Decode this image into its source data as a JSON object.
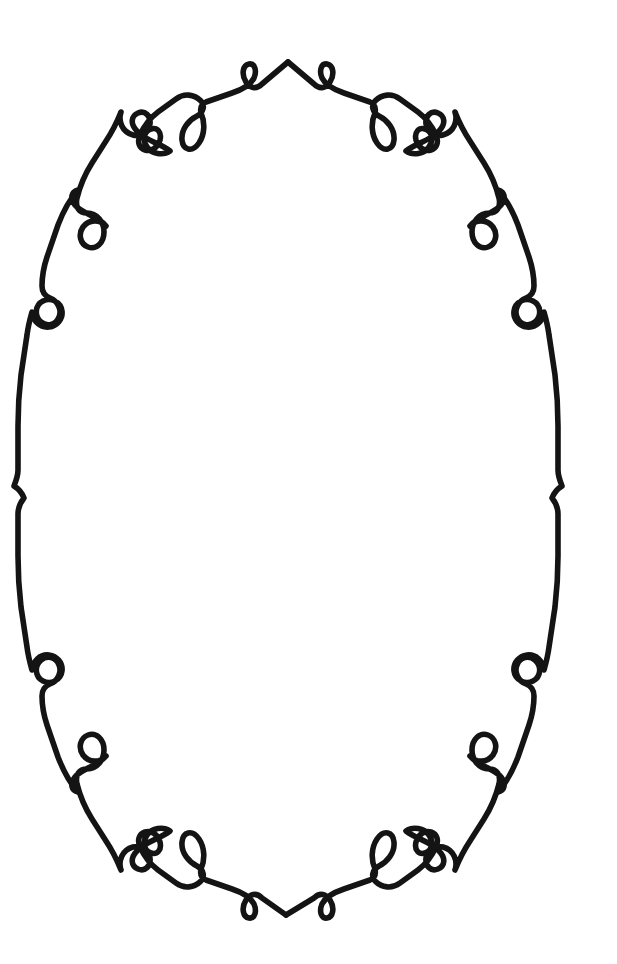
{
  "artwork": {
    "title": "Ornamental Oval Scroll Frame",
    "kind": "line-art-decorative-border",
    "medium": "black ink line drawing",
    "canvas": {
      "width": 617,
      "height": 964
    },
    "background_color": "#ffffff",
    "ink_color": "#141414",
    "stroke_width": 5.6,
    "symmetry": "bilateral vertical axis at x=287; near mirror symmetry about horizontal axis y=492",
    "bounds": {
      "left": 14,
      "right": 560,
      "top": 58,
      "bottom": 925
    },
    "center": {
      "x": 287,
      "y": 492
    },
    "description": "A single continuous hand-drawn black line forms a tall oval cartouche frame. The line is punctuated at regular intervals by decorative flourishes: teardrop loops, small closed rings, paired C-scroll curls and pointed cusps. The interior is empty white space.",
    "ornaments": [
      {
        "name": "top-apex-peak",
        "shape": "upward point",
        "x": 288,
        "y": 62
      },
      {
        "name": "top-loop-left",
        "shape": "small teardrop loop",
        "x": 248,
        "y": 75
      },
      {
        "name": "top-loop-right",
        "shape": "small teardrop loop",
        "x": 325,
        "y": 75
      },
      {
        "name": "shoulder-loop-left",
        "shape": "teardrop loop",
        "x": 195,
        "y": 130
      },
      {
        "name": "shoulder-loop-right",
        "shape": "teardrop loop",
        "x": 378,
        "y": 130
      },
      {
        "name": "corner-curl-upper-left",
        "shape": "double C-scroll",
        "x": 132,
        "y": 140
      },
      {
        "name": "corner-curl-upper-right",
        "shape": "double C-scroll",
        "x": 443,
        "y": 140
      },
      {
        "name": "side-loop-upper-left",
        "shape": "teardrop loop",
        "x": 88,
        "y": 228
      },
      {
        "name": "side-loop-upper-right",
        "shape": "teardrop loop",
        "x": 484,
        "y": 228
      },
      {
        "name": "side-ring-upper-left",
        "shape": "small closed ring",
        "x": 40,
        "y": 307
      },
      {
        "name": "side-ring-upper-right",
        "shape": "small closed ring",
        "x": 531,
        "y": 307
      },
      {
        "name": "side-cusp-left",
        "shape": "outward cusp notch",
        "x": 18,
        "y": 488
      },
      {
        "name": "side-cusp-right",
        "shape": "outward cusp notch",
        "x": 556,
        "y": 488
      },
      {
        "name": "side-ring-lower-left",
        "shape": "small closed ring",
        "x": 40,
        "y": 668
      },
      {
        "name": "side-ring-lower-right",
        "shape": "small closed ring",
        "x": 531,
        "y": 668
      },
      {
        "name": "side-loop-lower-left",
        "shape": "teardrop loop",
        "x": 90,
        "y": 745
      },
      {
        "name": "side-loop-lower-right",
        "shape": "teardrop loop",
        "x": 482,
        "y": 745
      },
      {
        "name": "corner-curl-lower-left",
        "shape": "double C-scroll",
        "x": 128,
        "y": 840
      },
      {
        "name": "corner-curl-lower-right",
        "shape": "double C-scroll",
        "x": 447,
        "y": 840
      },
      {
        "name": "bottom-shoulder-loop-left",
        "shape": "teardrop loop",
        "x": 200,
        "y": 845
      },
      {
        "name": "bottom-shoulder-loop-right",
        "shape": "teardrop loop",
        "x": 372,
        "y": 845
      },
      {
        "name": "bottom-loop-left",
        "shape": "small teardrop loop",
        "x": 247,
        "y": 905
      },
      {
        "name": "bottom-loop-right",
        "shape": "small teardrop loop",
        "x": 324,
        "y": 905
      },
      {
        "name": "bottom-apex-point",
        "shape": "downward point",
        "x": 286,
        "y": 915
      }
    ]
  },
  "paths": {
    "left_rail": "M 288 62 L 262 84 C 256 90 250 88 246 82 C 241 74 243 65 249 64 C 255 63 257 71 254 78 C 250 86 241 90 232 93 L 206 102 C 201 104 200 108 201 113 C 205 122 205 134 199 143 C 192 153 183 150 182 140 C 181 129 189 120 197 116 C 204 112 205 105 201 101 C 194 94 184 93 176 99 L 158 112 C 150 118 144 126 140 135 C 137 142 139 148 145 150 C 152 152 158 147 160 140 C 162 132 157 127 151 129 C 144 131 142 140 147 147 C 152 154 163 156 170 151 C 160 143 146 141 137 131 C 130 124 131 116 138 113 C 145 110 151 116 150 124 C 149 132 141 137 133 135 C 122 132 118 121 121 112 C 117 122 112 132 106 141 L 92 163 C 85 174 80 186 77 198 C 75 207 79 213 87 213 C 97 213 104 222 104 232 C 104 243 96 250 88 247 C 80 244 78 234 83 227 C 89 219 100 219 106 226 C 97 215 82 214 75 205 C 70 198 71 192 78 190 C 69 200 63 212 58 225 L 47 257 C 44 266 42 276 42 286 C 42 292 45 296 50 298 C 58 301 62 310 59 317 C 56 325 47 327 41 322 C 34 316 35 305 43 301 C 51 297 61 302 62 311 C 63 319 57 326 49 327 C 40 328 33 321 32 312 C 30 319 28 327 27 335 L 21 375 C 19 392 18 409 18 426 L 18 470 C 18 476 16 481 14 486 C 19 489 22 493 24 498 C 20 503 18 508 18 514 L 18 556 C 18 573 19 590 21 607 L 27 647 C 28 655 30 663 32 670 C 33 661 40 654 49 655 C 57 656 63 663 62 671 C 61 680 51 685 43 681 C 35 677 34 666 41 660 C 47 655 56 657 59 665 C 62 672 58 681 50 684 C 45 686 42 690 42 696 C 42 706 44 716 47 725 L 58 757 C 63 770 69 782 78 792 C 71 790 70 784 75 777 C 82 768 97 767 106 756 C 100 763 89 763 83 755 C 78 748 80 738 88 735 C 96 732 104 739 104 750 C 104 760 97 769 87 769 C 79 769 75 775 77 784 C 80 796 85 808 92 819 L 106 841 C 112 850 117 860 121 870 C 118 861 122 850 133 847 C 141 845 149 850 150 858 C 151 866 145 872 138 869 C 131 866 130 858 137 851 C 146 841 160 839 170 831 C 163 826 152 828 147 835 C 142 842 144 851 151 853 C 157 855 162 850 160 842 C 158 835 152 830 145 832 C 139 834 137 840 140 847 C 144 856 150 864 158 870 L 176 883 C 184 889 194 888 201 881 C 205 877 204 870 197 866 C 189 862 181 853 182 842 C 183 832 192 829 199 839 C 205 848 205 860 201 869 C 200 874 201 878 206 880 L 232 889 C 241 892 250 896 254 904 C 257 911 255 919 249 918 C 243 917 241 908 246 900 C 250 894 256 892 262 898 L 286 915",
    "right_rail": "M 288 62 L 314 84 C 320 90 326 88 330 82 C 335 74 333 65 327 64 C 321 63 319 71 322 78 C 326 86 335 90 344 93 L 370 102 C 375 104 376 108 375 113 C 371 122 371 134 377 143 C 384 153 393 150 394 140 C 395 129 387 120 379 116 C 372 112 371 105 375 101 C 382 94 392 93 400 99 L 418 112 C 426 118 432 126 436 135 C 439 142 437 148 431 150 C 424 152 418 147 416 140 C 414 132 419 127 425 129 C 432 131 434 140 429 147 C 424 154 413 156 406 151 C 416 143 430 141 439 131 C 446 124 445 116 438 113 C 431 110 425 116 426 124 C 427 132 435 137 443 135 C 454 132 458 121 455 112 C 459 122 464 132 470 141 L 484 163 C 491 174 496 186 499 198 C 501 207 497 213 489 213 C 479 213 472 222 472 232 C 472 243 480 250 488 247 C 496 244 498 234 493 227 C 487 219 476 219 470 226 C 479 215 494 214 501 205 C 506 198 505 192 498 190 C 507 200 513 212 518 225 L 529 257 C 532 266 534 276 534 286 C 534 292 531 296 526 298 C 518 301 514 310 517 317 C 520 325 529 327 535 322 C 542 316 541 305 533 301 C 525 297 515 302 514 311 C 513 319 519 326 527 327 C 536 328 543 321 544 312 C 546 319 548 327 549 335 L 555 375 C 557 392 558 409 558 426 L 558 470 C 558 476 560 481 562 486 C 557 489 554 493 552 498 C 556 503 558 508 558 514 L 558 556 C 558 573 557 590 555 607 L 549 647 C 548 655 546 663 544 670 C 543 661 536 654 527 655 C 519 656 513 663 514 671 C 515 680 525 685 533 681 C 541 677 542 666 535 660 C 529 655 520 657 517 665 C 514 672 518 681 526 684 C 531 686 534 690 534 696 C 534 706 532 716 529 725 L 518 757 C 513 770 507 782 498 792 C 505 790 506 784 501 777 C 494 768 479 767 470 756 C 476 763 487 763 493 755 C 498 748 496 738 488 735 C 480 732 472 739 472 750 C 472 760 479 769 489 769 C 497 769 501 775 499 784 C 496 796 491 808 484 819 L 470 841 C 464 850 459 860 455 870 C 458 861 454 850 443 847 C 435 845 427 850 426 858 C 425 866 431 872 438 869 C 445 866 446 858 439 851 C 430 841 416 839 406 831 C 413 826 424 828 429 835 C 434 842 432 851 425 853 C 419 855 414 850 416 842 C 418 835 424 830 431 832 C 437 834 439 840 436 847 C 432 856 426 864 418 870 L 400 883 C 392 889 382 888 375 881 C 371 877 372 870 379 866 C 387 862 395 853 394 842 C 393 832 384 829 377 839 C 371 848 371 860 375 869 C 376 874 375 878 370 880 L 344 889 C 335 892 326 896 322 904 C 319 911 321 919 327 918 C 333 917 335 908 330 900 C 326 894 320 892 314 898 L 286 915"
  }
}
